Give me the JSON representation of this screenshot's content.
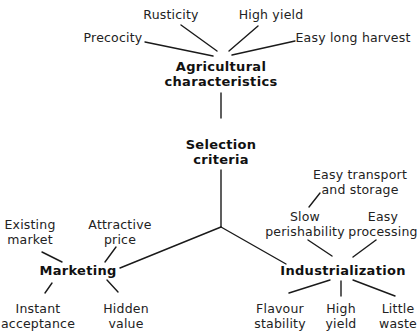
{
  "diagram": {
    "type": "concept-tree",
    "root": {
      "label_line1": "Selection",
      "label_line2": "criteria"
    },
    "branches": [
      {
        "id": "agricultural",
        "label_line1": "Agricultural",
        "label_line2": "characteristics",
        "children": [
          {
            "label": "Precocity"
          },
          {
            "label": "Rusticity"
          },
          {
            "label": "High yield"
          },
          {
            "label": "Easy long harvest"
          }
        ]
      },
      {
        "id": "marketing",
        "label": "Marketing",
        "children": [
          {
            "label_line1": "Existing",
            "label_line2": "market"
          },
          {
            "label_line1": "Attractive",
            "label_line2": "price"
          },
          {
            "label_line1": "Instant",
            "label_line2": "acceptance"
          },
          {
            "label_line1": "Hidden",
            "label_line2": "value"
          }
        ]
      },
      {
        "id": "industrialization",
        "label": "Industrialization",
        "children": [
          {
            "label_line1": "Slow",
            "label_line2": "perishability",
            "children": [
              {
                "label_line1": "Easy transport",
                "label_line2": "and storage"
              }
            ]
          },
          {
            "label_line1": "Easy",
            "label_line2": "processing"
          },
          {
            "label_line1": "Flavour",
            "label_line2": "stability"
          },
          {
            "label_line1": "High",
            "label_line2": "yield"
          },
          {
            "label_line1": "Little",
            "label_line2": "waste"
          }
        ]
      }
    ]
  },
  "colors": {
    "background": "#ffffff",
    "text": "#222222",
    "lines": "#1a1a1a"
  }
}
